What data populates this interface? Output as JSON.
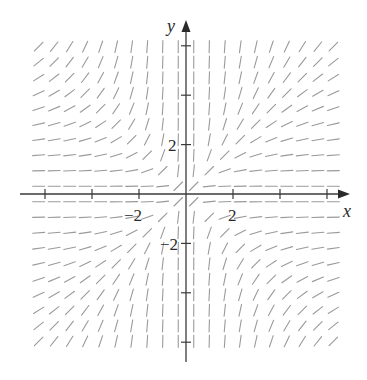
{
  "chart_data": {
    "type": "direction_field",
    "title": "",
    "xlabel": "x",
    "ylabel": "y",
    "slope_function": "y^2/x^2",
    "xlim": [
      -6.5,
      6.5
    ],
    "ylim": [
      -7,
      7
    ],
    "x_ticks": [
      -6,
      -4,
      -2,
      0,
      2,
      4,
      6
    ],
    "y_ticks": [
      -6,
      -4,
      -2,
      0,
      2,
      4,
      6
    ],
    "x_tick_labels": [
      {
        "value": -2,
        "text": "−2"
      },
      {
        "value": 2,
        "text": "2"
      }
    ],
    "y_tick_labels": [
      {
        "value": 2,
        "text": "2"
      },
      {
        "value": -2,
        "text": "−2"
      }
    ],
    "grid_points_per_axis": 20,
    "grid_spacing_units": 0.66,
    "grid": false,
    "segment_color": "#9a9a9a",
    "axis_color": "#3a3a3a"
  },
  "labels": {
    "x_axis": "x",
    "y_axis": "y",
    "x_neg2": "−2",
    "x_pos2": "2",
    "y_pos2": "2",
    "y_neg2": "−2"
  }
}
